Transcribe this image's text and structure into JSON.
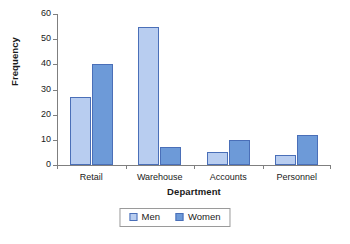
{
  "chart_data": {
    "type": "bar",
    "title": "",
    "subtitle": "",
    "xlabel": "Department",
    "ylabel": "Frequency",
    "categories": [
      "Retail",
      "Warehouse",
      "Accounts",
      "Personnel"
    ],
    "series": [
      {
        "name": "Men",
        "color": "#b8cdf0",
        "values": [
          27,
          55,
          5,
          4
        ]
      },
      {
        "name": "Women",
        "color": "#6d9ad8",
        "values": [
          40,
          7,
          10,
          12
        ]
      }
    ],
    "ylim": [
      0,
      60
    ],
    "ytick_step": 10,
    "yticks": [
      0,
      10,
      20,
      30,
      40,
      50,
      60
    ],
    "ytick_labels": [
      "0",
      "10",
      "20",
      "30",
      "40",
      "50",
      "60"
    ],
    "grid": false,
    "legend_position": "bottom",
    "bar_border_color": "#4a6fb8",
    "axis_color": "#7f7f7f",
    "background": "#ffffff"
  },
  "legend": {
    "items": [
      {
        "label": "Men"
      },
      {
        "label": "Women"
      }
    ]
  }
}
